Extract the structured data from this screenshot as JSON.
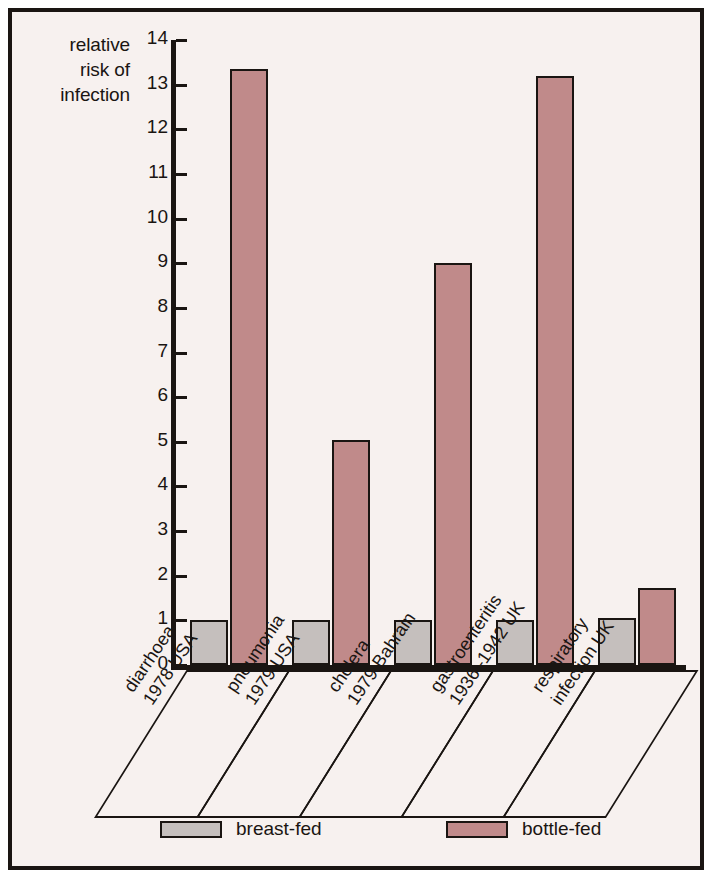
{
  "chart_data": {
    "type": "bar",
    "title": "",
    "xlabel": "",
    "ylabel": "relative risk of infection",
    "ylabel_lines": [
      "relative",
      "risk of",
      "infection"
    ],
    "ylim": [
      0,
      14
    ],
    "yticks": [
      0,
      1,
      2,
      3,
      4,
      5,
      6,
      7,
      8,
      9,
      10,
      11,
      12,
      13,
      14
    ],
    "ytick_labels": [
      "0",
      "1",
      "2",
      "3",
      "4",
      "5",
      "6",
      "7",
      "8",
      "9",
      "10",
      "11",
      "12",
      "13",
      "14"
    ],
    "grid": false,
    "legend_position": "bottom",
    "categories": [
      "diarrhoea 1978 USA",
      "pneumonia 1979 USA",
      "cholera 1979 Bahrain",
      "gastroenteritis 1936–1942 UK",
      "respiratory infection UK"
    ],
    "category_lines": [
      [
        "diarrhoea",
        "1978 USA"
      ],
      [
        "pneumonia",
        "1979 USA"
      ],
      [
        "cholera",
        "1979 Bahrain"
      ],
      [
        "gastroenteritis",
        "1936–1942 UK"
      ],
      [
        "respiratory",
        "infection UK"
      ]
    ],
    "series": [
      {
        "name": "breast-fed",
        "color": "#c5bfbd",
        "values": [
          1.0,
          1.0,
          1.0,
          1.0,
          1.05
        ]
      },
      {
        "name": "bottle-fed",
        "color": "#c08a8a",
        "values": [
          13.35,
          5.05,
          9.0,
          13.2,
          1.72
        ]
      }
    ]
  },
  "legend": {
    "items": [
      {
        "label": "breast-fed",
        "color": "#c5bfbd"
      },
      {
        "label": "bottle-fed",
        "color": "#c08a8a"
      }
    ]
  },
  "style": {
    "ink": "#1a1512",
    "background": "#f7f1ef",
    "page_background": "#ffffff"
  }
}
